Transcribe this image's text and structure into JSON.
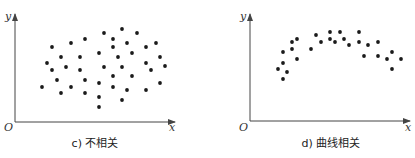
{
  "chart_data": [
    {
      "type": "scatter",
      "title": "",
      "caption": "c) 不相关",
      "xlabel": "x",
      "ylabel": "y",
      "origin_label": "O",
      "grid": false,
      "legend": null,
      "axes_px": {
        "x0": 15,
        "y0": 122,
        "x_end": 175,
        "y_top": 14
      },
      "points_px": [
        [
          42,
          87
        ],
        [
          47,
          63
        ],
        [
          52,
          47
        ],
        [
          52,
          70
        ],
        [
          57,
          80
        ],
        [
          61,
          57
        ],
        [
          61,
          93
        ],
        [
          66,
          67
        ],
        [
          71,
          43
        ],
        [
          71,
          87
        ],
        [
          80,
          57
        ],
        [
          80,
          70
        ],
        [
          85,
          39
        ],
        [
          85,
          80
        ],
        [
          85,
          93
        ],
        [
          99,
          53
        ],
        [
          99,
          83
        ],
        [
          99,
          97
        ],
        [
          99,
          107
        ],
        [
          104,
          33
        ],
        [
          104,
          67
        ],
        [
          113,
          39
        ],
        [
          113,
          47
        ],
        [
          113,
          76
        ],
        [
          113,
          87
        ],
        [
          118,
          57
        ],
        [
          122,
          29
        ],
        [
          122,
          67
        ],
        [
          122,
          100
        ],
        [
          127,
          43
        ],
        [
          127,
          90
        ],
        [
          132,
          53
        ],
        [
          132,
          76
        ],
        [
          137,
          33
        ],
        [
          146,
          47
        ],
        [
          146,
          63
        ],
        [
          146,
          90
        ],
        [
          151,
          70
        ],
        [
          156,
          43
        ],
        [
          160,
          57
        ],
        [
          160,
          83
        ],
        [
          165,
          66
        ]
      ]
    },
    {
      "type": "scatter",
      "title": "",
      "caption": "d) 曲线相关",
      "xlabel": "x",
      "ylabel": "y",
      "origin_label": "O",
      "grid": false,
      "legend": null,
      "axes_px": {
        "x0": 250,
        "y0": 121,
        "x_end": 410,
        "y_top": 14
      },
      "points_px": [
        [
          278,
          69
        ],
        [
          283,
          79
        ],
        [
          283,
          63
        ],
        [
          283,
          52
        ],
        [
          287,
          72
        ],
        [
          292,
          49
        ],
        [
          292,
          42
        ],
        [
          297,
          39
        ],
        [
          297,
          59
        ],
        [
          311,
          49
        ],
        [
          316,
          35
        ],
        [
          321,
          42
        ],
        [
          330,
          32
        ],
        [
          330,
          39
        ],
        [
          335,
          42
        ],
        [
          340,
          32
        ],
        [
          344,
          39
        ],
        [
          349,
          45
        ],
        [
          359,
          32
        ],
        [
          359,
          42
        ],
        [
          364,
          56
        ],
        [
          368,
          45
        ],
        [
          378,
          42
        ],
        [
          378,
          56
        ],
        [
          387,
          59
        ],
        [
          392,
          52
        ],
        [
          392,
          69
        ],
        [
          401,
          59
        ]
      ]
    }
  ],
  "colors": {
    "axis": "#444444",
    "point": "#1a1a1a",
    "text": "#222222"
  }
}
